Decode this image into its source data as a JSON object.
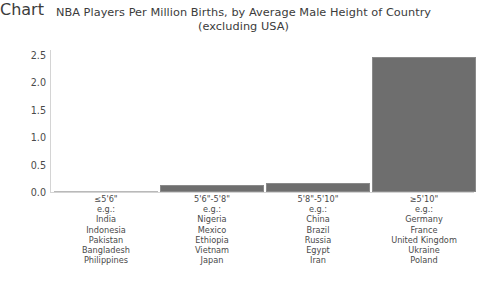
{
  "chart_data": {
    "type": "bar",
    "title": "NBA Players Per Million Births, by Average Male Height of Country (excluding USA)",
    "title_lines": [
      "NBA Players Per Million Births, by Average Male Height of Country",
      "(excluding USA)"
    ],
    "xlabel": "",
    "ylabel": "",
    "ylim": [
      0,
      2.65
    ],
    "yticks": [
      "2.5",
      "2.0",
      "1.5",
      "1.0",
      "0.5",
      "0.0"
    ],
    "ytick_values": [
      2.5,
      2.0,
      1.5,
      1.0,
      0.5,
      0.0
    ],
    "grid": false,
    "legend": "none",
    "bar_color": "#6e6e6e",
    "categories": [
      "≤5'6\"",
      "5'6\"-5'8\"",
      "5'8\"-5'10\"",
      "≥5'10\""
    ],
    "values": [
      0.01,
      0.13,
      0.17,
      2.52
    ],
    "examples_label": "e.g.:",
    "examples": [
      [
        "India",
        "Indonesia",
        "Pakistan",
        "Bangladesh",
        "Philippines"
      ],
      [
        "Nigeria",
        "Mexico",
        "Ethiopia",
        "Vietnam",
        "Japan"
      ],
      [
        "China",
        "Brazil",
        "Russia",
        "Egypt",
        "Iran"
      ],
      [
        "Germany",
        "France",
        "United Kingdom",
        "Ukraine",
        "Poland"
      ]
    ]
  }
}
